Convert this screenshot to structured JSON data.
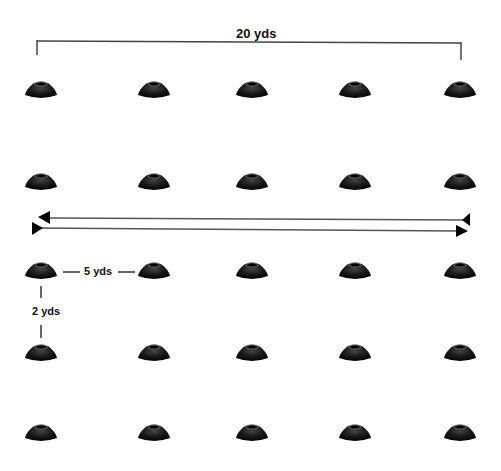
{
  "diagram": {
    "type": "cone-drill-layout",
    "grid": {
      "rows": 5,
      "columns": 5,
      "column_x": [
        41,
        154,
        252,
        355,
        460
      ],
      "row_y": [
        90,
        182,
        271,
        353,
        433
      ]
    },
    "labels": {
      "total_width": "20 yds",
      "horizontal_spacing": "5 yds",
      "vertical_spacing": "2 yds"
    },
    "arrows": [
      {
        "direction": "left",
        "y": 218,
        "x_start": 470,
        "x_end": 38
      },
      {
        "direction": "right",
        "y": 229,
        "x_start": 32,
        "x_end": 466
      }
    ],
    "colors": {
      "cone": "#111111",
      "cone_highlight": "#3a3a3a",
      "line": "#444444",
      "background": "#ffffff"
    }
  }
}
